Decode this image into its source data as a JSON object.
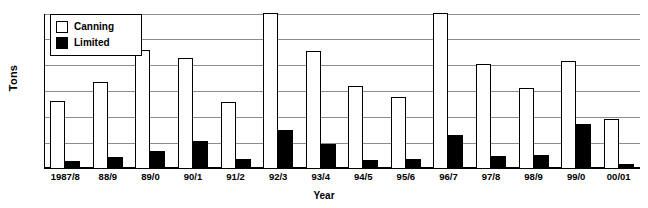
{
  "chart_data": {
    "type": "bar",
    "title": "",
    "xlabel": "Year",
    "ylabel": "Tons",
    "ylim": [
      0,
      120
    ],
    "yticks": [
      0,
      20,
      40,
      60,
      80,
      100,
      120
    ],
    "grid": true,
    "legend_position": "top-left",
    "categories": [
      "1987/8",
      "88/9",
      "89/0",
      "90/1",
      "91/2",
      "92/3",
      "93/4",
      "94/5",
      "95/6",
      "96/7",
      "97/8",
      "98/9",
      "99/0",
      "00/01"
    ],
    "series": [
      {
        "name": "Canning",
        "color": "#ffffff",
        "values": [
          53,
          67,
          92,
          86,
          52,
          121,
          91,
          64,
          56,
          121,
          81,
          63,
          84,
          39
        ]
      },
      {
        "name": "Limited",
        "color": "#000000",
        "values": [
          6,
          9,
          14,
          22,
          8,
          30,
          19,
          7,
          8,
          26,
          10,
          11,
          35,
          4
        ]
      }
    ]
  },
  "legend": {
    "items": [
      {
        "label": "Canning",
        "swatch": "open-square-swatch"
      },
      {
        "label": "Limited",
        "swatch": "filled-square-swatch"
      }
    ]
  },
  "axes": {
    "y_title": "Tons",
    "x_title": "Year",
    "y_tick_labels": [
      "120",
      "100",
      "80",
      "60",
      "40",
      "20",
      "0"
    ]
  }
}
